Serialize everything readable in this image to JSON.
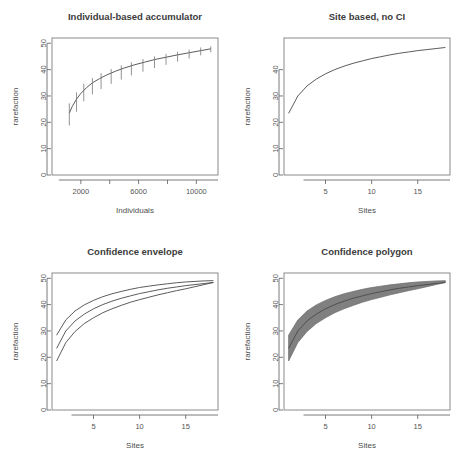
{
  "figure": {
    "layout": "2x2 grid of rarefaction plots",
    "background": "#ffffff",
    "line_color": "#4a4a4a",
    "fill_color": "#808080"
  },
  "chart_data": [
    {
      "id": "individual-based-accumulator",
      "type": "line",
      "title": "Individual-based accumulator",
      "xlabel": "Individuals",
      "ylabel": "rarefaction",
      "xlim": [
        0,
        11500
      ],
      "ylim": [
        0,
        52
      ],
      "xticks": [
        2000,
        4000,
        6000,
        8000,
        10000
      ],
      "xtick_labels": [
        "2000",
        "",
        "6000",
        "",
        "10000"
      ],
      "yticks": [
        0,
        10,
        20,
        30,
        40,
        50
      ],
      "ytick_labels": [
        "0",
        "10",
        "20",
        "30",
        "40",
        "50"
      ],
      "grid": false,
      "legend": "none",
      "x": [
        1200,
        1400,
        1700,
        2000,
        2400,
        2800,
        3300,
        3800,
        4400,
        5000,
        5700,
        6400,
        7100,
        7900,
        8700,
        9500,
        10300,
        11000
      ],
      "y": [
        23.5,
        26.0,
        28.8,
        31.0,
        33.2,
        35.0,
        36.6,
        38.0,
        39.4,
        40.6,
        41.8,
        42.8,
        43.8,
        44.7,
        45.6,
        46.4,
        47.2,
        47.9
      ],
      "error_bars": {
        "x": [
          1200,
          1700,
          2200,
          2800,
          3400,
          4100,
          4800,
          5500,
          6300,
          7100,
          7900,
          8700,
          9500,
          10300,
          11000
        ],
        "lower": [
          18.8,
          24.0,
          28.0,
          30.6,
          32.6,
          34.6,
          36.2,
          37.8,
          39.2,
          40.6,
          41.8,
          43.0,
          44.2,
          45.4,
          46.6
        ],
        "upper": [
          27.2,
          31.4,
          34.6,
          36.8,
          38.6,
          40.2,
          41.6,
          42.8,
          44.0,
          45.0,
          46.0,
          46.8,
          47.6,
          48.4,
          48.8
        ]
      }
    },
    {
      "id": "site-based-no-ci",
      "type": "line",
      "title": "Site based, no CI",
      "xlabel": "Sites",
      "ylabel": "rarefaction",
      "xlim": [
        0.5,
        18.5
      ],
      "ylim": [
        0,
        52
      ],
      "xticks": [
        5,
        10,
        15
      ],
      "xtick_labels": [
        "5",
        "10",
        "15"
      ],
      "yticks": [
        0,
        10,
        20,
        30,
        40
      ],
      "ytick_labels": [
        "0",
        "10",
        "20",
        "30",
        "40"
      ],
      "grid": false,
      "legend": "none",
      "x": [
        1,
        2,
        3,
        4,
        5,
        6,
        7,
        8,
        9,
        10,
        11,
        12,
        13,
        14,
        15,
        16,
        17,
        18
      ],
      "y": [
        23.4,
        30.0,
        33.8,
        36.4,
        38.4,
        40.0,
        41.3,
        42.4,
        43.3,
        44.2,
        44.9,
        45.6,
        46.2,
        46.7,
        47.2,
        47.6,
        48.0,
        48.4
      ]
    },
    {
      "id": "confidence-envelope",
      "type": "line",
      "title": "Confidence envelope",
      "xlabel": "Sites",
      "ylabel": "rarefaction",
      "xlim": [
        0.5,
        18.5
      ],
      "ylim": [
        0,
        52
      ],
      "xticks": [
        5,
        10,
        15
      ],
      "xtick_labels": [
        "5",
        "10",
        "15"
      ],
      "yticks": [
        0,
        10,
        20,
        30,
        40,
        50
      ],
      "ytick_labels": [
        "0",
        "10",
        "20",
        "30",
        "40",
        "50"
      ],
      "grid": false,
      "legend": "none",
      "x": [
        1,
        2,
        3,
        4,
        5,
        6,
        7,
        8,
        9,
        10,
        11,
        12,
        13,
        14,
        15,
        16,
        17,
        18
      ],
      "series": [
        {
          "name": "upper confidence limit",
          "values": [
            28.4,
            34.2,
            37.6,
            39.9,
            41.6,
            43.0,
            44.1,
            45.0,
            45.8,
            46.5,
            47.0,
            47.5,
            47.9,
            48.3,
            48.6,
            48.8,
            49.0,
            49.1
          ]
        },
        {
          "name": "mean rarefaction",
          "values": [
            23.4,
            30.0,
            33.8,
            36.4,
            38.4,
            40.0,
            41.3,
            42.4,
            43.3,
            44.2,
            44.9,
            45.6,
            46.2,
            46.7,
            47.2,
            47.6,
            48.0,
            48.4
          ]
        },
        {
          "name": "lower confidence limit",
          "values": [
            18.6,
            25.6,
            29.8,
            32.8,
            35.0,
            36.9,
            38.4,
            39.7,
            40.9,
            41.9,
            42.8,
            43.7,
            44.5,
            45.3,
            46.0,
            46.8,
            47.6,
            48.4
          ]
        }
      ]
    },
    {
      "id": "confidence-polygon",
      "type": "area",
      "title": "Confidence polygon",
      "xlabel": "Sites",
      "ylabel": "rarefaction",
      "xlim": [
        0.5,
        18.5
      ],
      "ylim": [
        0,
        52
      ],
      "xticks": [
        5,
        10,
        15
      ],
      "xtick_labels": [
        "5",
        "10",
        "15"
      ],
      "yticks": [
        0,
        10,
        20,
        30,
        40,
        50
      ],
      "ytick_labels": [
        "0",
        "10",
        "20",
        "30",
        "40",
        "50"
      ],
      "grid": false,
      "legend": "none",
      "fill_color": "#808080",
      "x": [
        1,
        2,
        3,
        4,
        5,
        6,
        7,
        8,
        9,
        10,
        11,
        12,
        13,
        14,
        15,
        16,
        17,
        18
      ],
      "series": [
        {
          "name": "upper confidence limit",
          "values": [
            28.4,
            34.2,
            37.6,
            39.9,
            41.6,
            43.0,
            44.1,
            45.0,
            45.8,
            46.5,
            47.0,
            47.5,
            47.9,
            48.3,
            48.6,
            48.8,
            49.0,
            49.1
          ]
        },
        {
          "name": "mean rarefaction",
          "values": [
            23.4,
            30.0,
            33.8,
            36.4,
            38.4,
            40.0,
            41.3,
            42.4,
            43.3,
            44.2,
            44.9,
            45.6,
            46.2,
            46.7,
            47.2,
            47.6,
            48.0,
            48.4
          ]
        },
        {
          "name": "lower confidence limit",
          "values": [
            18.6,
            25.6,
            29.8,
            32.8,
            35.0,
            36.9,
            38.4,
            39.7,
            40.9,
            41.9,
            42.8,
            43.7,
            44.5,
            45.3,
            46.0,
            46.8,
            47.6,
            48.4
          ]
        }
      ]
    }
  ]
}
